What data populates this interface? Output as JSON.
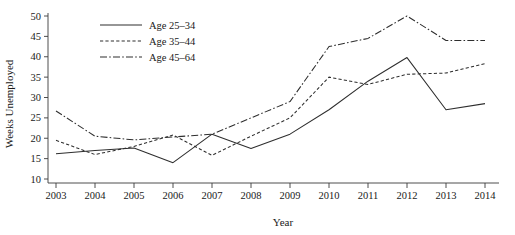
{
  "chart_data": {
    "type": "line",
    "title": "",
    "xlabel": "Year",
    "ylabel": "Weeks Unemployed",
    "x": [
      2003,
      2004,
      2005,
      2006,
      2007,
      2008,
      2009,
      2010,
      2011,
      2012,
      2013,
      2014
    ],
    "xticklabels": [
      "2003",
      "2004",
      "2005",
      "2006",
      "2007",
      "2008",
      "2009",
      "2010",
      "2011",
      "2012",
      "2013",
      "2014"
    ],
    "yticklabels": [
      "10",
      "15",
      "20",
      "25",
      "30",
      "35",
      "40",
      "45",
      "50"
    ],
    "yticks": [
      10,
      15,
      20,
      25,
      30,
      35,
      40,
      45,
      50
    ],
    "xlim": [
      2003,
      2014
    ],
    "ylim": [
      8.5,
      51
    ],
    "grid": false,
    "legend_position": "top-left",
    "series": [
      {
        "name": "Age 25–34",
        "dash": "solid",
        "values": [
          16.2,
          17.0,
          17.6,
          14.0,
          21.0,
          17.5,
          21.0,
          27.0,
          34.0,
          39.8,
          27.0,
          28.5
        ]
      },
      {
        "name": "Age 35–44",
        "dash": "dotted",
        "values": [
          19.5,
          16.0,
          18.0,
          20.8,
          15.8,
          20.5,
          25.0,
          35.0,
          33.2,
          35.7,
          36.0,
          38.3
        ]
      },
      {
        "name": "Age 45–64",
        "dash": "dashdot",
        "values": [
          26.7,
          20.5,
          19.6,
          20.3,
          21.0,
          25.0,
          29.0,
          42.5,
          44.5,
          50.0,
          44.0,
          44.0
        ]
      }
    ]
  },
  "legend": {
    "entries": [
      {
        "label": "Age 25–34"
      },
      {
        "label": "Age 35–44"
      },
      {
        "label": "Age 45–64"
      }
    ]
  },
  "colors": {
    "line": "#2e2e2e",
    "axis": "#3a3a3a",
    "text": "#1a1a1a",
    "background": "#ffffff"
  }
}
